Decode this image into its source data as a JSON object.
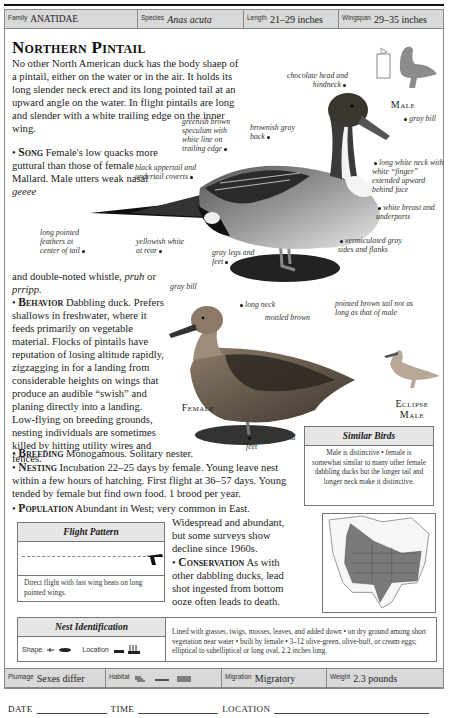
{
  "header": {
    "family_label": "Family",
    "family_value": "ANATIDAE",
    "species_label": "Species",
    "species_value": "Anas acuta",
    "length_label": "Length",
    "length_value": "21–29 inches",
    "wingspan_label": "Wingspan",
    "wingspan_value": "29–35 inches"
  },
  "title": "Northern Pintail",
  "intro": "No other North American duck has the body shaep of a pintail, either on the water or in the air. It holds its long slender neck erect and its long pointed tail at an upward angle on the water. In flight pintails are long and slender with a white trailing edge on the inner wing.",
  "song": {
    "head": "Song",
    "text": "Female's low quacks more guttural than those of female Mallard. Male utters weak nasal",
    "call1": "geeee",
    "text2": "and double-noted whistle,",
    "call2": "pruh",
    "or": "or",
    "call3": "prripp."
  },
  "behavior": {
    "head": "Behavior",
    "text": "Dabbling duck. Prefers shallows in freshwater, where it feeds primarily on vegetable material. Flocks of pintails have reputation of losing altitude rapidly, zigzagging in for a landing from considerable heights on wings that produce an audible “swish” and planing directly into a landing. Low-flying on breeding grounds, nesting individuals are sometimes killed by hitting utility wires and fences."
  },
  "breeding": {
    "head": "Breeding",
    "text": "Monogamous. Solitary nester."
  },
  "nesting": {
    "head": "Nesting",
    "text": "Incubation 22–25 days by female. Young leave nest within a few hours of hatching. First flight at 36–57 days. Young tended by female but find own food. 1 brood per year."
  },
  "population": {
    "head": "Population",
    "text": "Abundant in West; very common in East.",
    "text2": "Widespread and abundant, but some surveys show decline since 1960s."
  },
  "conservation": {
    "head": "Conservation",
    "text": "As with other dabbling ducks, lead shot ingested from bottom ooze often leads to death."
  },
  "male_labels": {
    "sex": "Male",
    "chocolate_head": "chocolate head and hindneck",
    "gray_bill": "gray bill",
    "speculum": "greenish brown speculum with white line on trailing edge",
    "back": "brownish gray back",
    "uppertail": "black uppertail and undertail coverts",
    "neck": "long white neck with white “finger” extended upward behind face",
    "breast": "white breast and underparts",
    "tail": "long pointed feathers at center of tail",
    "rear": "yellowish white at rear",
    "legs": "gray legs and feet",
    "sides": "vermiculated gray sides and flanks"
  },
  "female_labels": {
    "sex": "Female",
    "bill": "gray bill",
    "neck": "long neck",
    "mottled": "mottled brown",
    "tail": "pointed brown tail not as long as that of male",
    "legs": "gray legs and feet"
  },
  "eclipse": {
    "line1": "Eclipse",
    "line2": "Male"
  },
  "similar_birds": {
    "title": "Similar Birds",
    "text": "Male is distinctive • female is somewhat similar to many other female dabbling ducks but the longer tail and longer neck make it distinctive."
  },
  "flight_pattern": {
    "title": "Flight Pattern",
    "text": "Direct flight with fast wing beats on long pointed wings."
  },
  "nest_identification": {
    "title": "Nest Identification",
    "shape_label": "Shape",
    "location_label": "Location",
    "text": "Lined with grasses, twigs, mosses, leaves, and added down • on dry ground among short vegetation near water • built by female • 3–12 olive-green, olive-buff, or cream eggs; elliptical to subelliptical or long oval, 2.2 inches long."
  },
  "footer": {
    "plumage_label": "Plumage",
    "plumage_value": "Sexes differ",
    "habitat_label": "Habitat",
    "migration_label": "Migration",
    "migration_value": "Migratory",
    "weight_label": "Weight",
    "weight_value": "2.3 pounds"
  },
  "log": {
    "date": "DATE",
    "time": "TIME",
    "location": "LOCATION"
  },
  "colors": {
    "header_bg": "#d9d9d9",
    "range_fill": "#7a7a7a",
    "silhouette": "#8c8c8c"
  }
}
